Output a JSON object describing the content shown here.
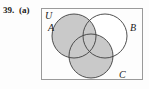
{
  "exercise": {
    "number": "39.",
    "part": "(a)"
  },
  "diagram": {
    "kind": "venn-diagram",
    "type": "three-set-venn",
    "universe_label": "U",
    "set_labels": {
      "a": "A",
      "b": "B",
      "c": "C"
    },
    "shading_note": "A and C shaded; B-only region unshaded",
    "colors": {
      "shade": "#c9c9c9",
      "outline": "#3c3c3c",
      "box_border": "#9a9a9a",
      "background": "#fdfdfd",
      "text": "#1a1a1a"
    },
    "geometry": {
      "box": {
        "x": 41,
        "y": 8,
        "width": 102,
        "height": 72
      },
      "circles": [
        {
          "name": "A",
          "cx": 74,
          "cy": 36,
          "r": 22,
          "shaded": true
        },
        {
          "name": "B",
          "cx": 105,
          "cy": 36,
          "r": 22,
          "shaded": false
        },
        {
          "name": "C",
          "cx": 91,
          "cy": 56,
          "r": 22,
          "shaded": true
        }
      ],
      "label_positions": {
        "U": {
          "x": 45,
          "y": 19
        },
        "A": {
          "x": 49,
          "y": 30
        },
        "B": {
          "x": 131,
          "y": 30
        },
        "C": {
          "x": 120,
          "y": 76
        }
      }
    }
  }
}
